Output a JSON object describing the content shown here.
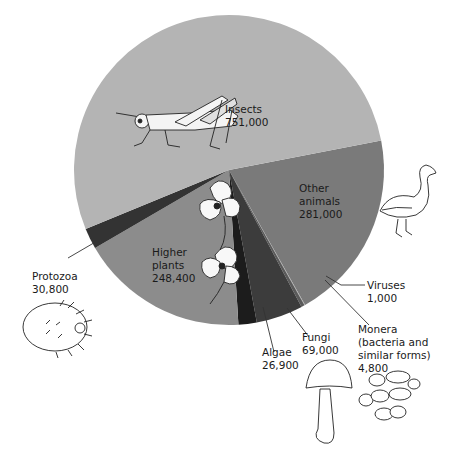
{
  "chart_data": {
    "type": "pie",
    "title": "",
    "unit": "number of known species",
    "start_angle_deg": -11,
    "direction": "clockwise",
    "slices": [
      {
        "label": "Other animals",
        "value": 281000,
        "color": "#7a7a7a"
      },
      {
        "label": "Viruses",
        "value": 1000,
        "color": "#a8a8a8"
      },
      {
        "label": "Monera (bacteria and similar forms)",
        "value": 4800,
        "color": "#5a5a5a"
      },
      {
        "label": "Fungi",
        "value": 69000,
        "color": "#3c3c3c"
      },
      {
        "label": "Algae",
        "value": 26900,
        "color": "#1c1c1c"
      },
      {
        "label": "Higher plants",
        "value": 248400,
        "color": "#8c8c8c"
      },
      {
        "label": "Protozoa",
        "value": 30800,
        "color": "#333333"
      },
      {
        "label": "Insects",
        "value": 751000,
        "color": "#b4b4b4"
      }
    ],
    "total": 1412900,
    "legend": "none (direct labels)"
  },
  "labels": {
    "insects": {
      "name": "Insects",
      "value": "751,000"
    },
    "other_animals": {
      "line1": "Other",
      "line2": "animals",
      "value": "281,000"
    },
    "higher_plants": {
      "line1": "Higher",
      "line2": "plants",
      "value": "248,400"
    },
    "protozoa": {
      "name": "Protozoa",
      "value": "30,800"
    },
    "algae": {
      "name": "Algae",
      "value": "26,900"
    },
    "fungi": {
      "name": "Fungi",
      "value": "69,000"
    },
    "monera": {
      "line1": "Monera",
      "line2": "(bacteria and",
      "line3": "similar forms)",
      "value": "4,800"
    },
    "viruses": {
      "name": "Viruses",
      "value": "1,000"
    }
  },
  "illustrations": [
    "grasshopper",
    "bird",
    "flowers",
    "protozoan",
    "mushroom",
    "bacteria"
  ]
}
